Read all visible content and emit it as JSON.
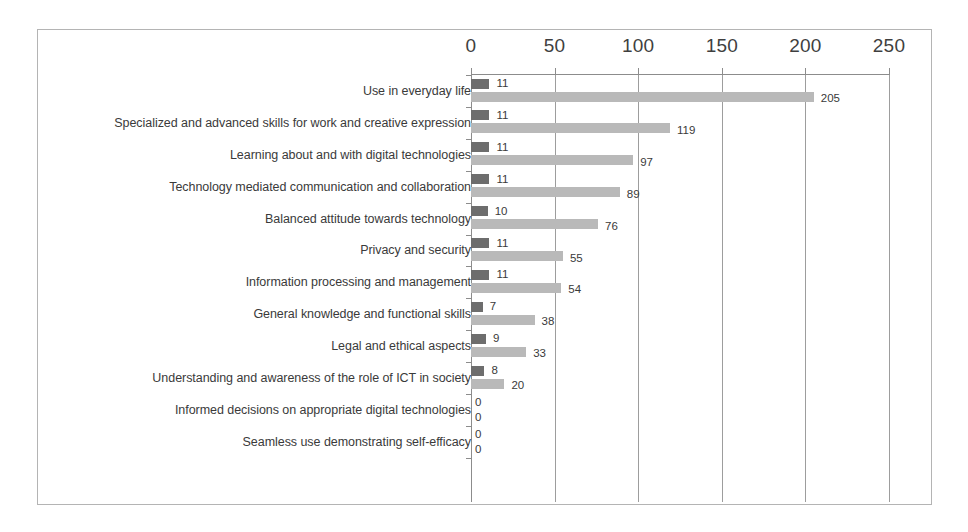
{
  "chart_data": {
    "type": "bar",
    "orientation": "horizontal",
    "title": "",
    "subtitle": "",
    "xlabel": "",
    "ylabel": "",
    "xlim": [
      0,
      250
    ],
    "xticks": [
      0,
      50,
      100,
      150,
      200,
      250
    ],
    "xtick_labels": [
      "0",
      "50",
      "100",
      "150",
      "200",
      "250"
    ],
    "grid": true,
    "grid_axis": "x",
    "legend": false,
    "legend_position": "none",
    "categories": [
      "Use in everyday life",
      "Specialized and advanced skills for work and creative expression",
      "Learning about and with digital technologies",
      "Technology mediated communication and collaboration",
      "Balanced attitude towards technology",
      "Privacy and security",
      "Information processing and management",
      "General knowledge and functional skills",
      "Legal and ethical aspects",
      "Understanding and awareness of the role of ICT in society",
      "Informed decisions on appropriate digital technologies",
      "Seamless use demonstrating self-efficacy"
    ],
    "series": [
      {
        "name": "series-a",
        "color": "#6d6d6d",
        "values": [
          11,
          11,
          11,
          11,
          10,
          11,
          11,
          7,
          9,
          8,
          0,
          0
        ],
        "labels": [
          "11",
          "11",
          "11",
          "11",
          "10",
          "11",
          "11",
          "7",
          "9",
          "8",
          "0",
          "0"
        ]
      },
      {
        "name": "series-b",
        "color": "#b9b9b9",
        "values": [
          205,
          119,
          97,
          89,
          76,
          55,
          54,
          38,
          33,
          20,
          0,
          0
        ],
        "labels": [
          "205",
          "119",
          "97",
          "89",
          "76",
          "55",
          "54",
          "38",
          "33",
          "20",
          "0",
          "0"
        ]
      }
    ]
  },
  "colors": {
    "series_a": "#6d6d6d",
    "series_b": "#b9b9b9",
    "axis": "#8c8c8c",
    "gridline": "#9d9d9d",
    "frame_border": "#b4b4b4",
    "text": "#3a3a3a",
    "background": "#ffffff"
  }
}
